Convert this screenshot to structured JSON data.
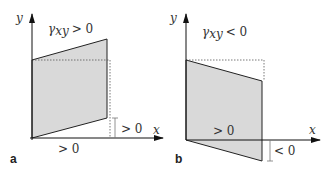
{
  "panels": [
    {
      "label": "a",
      "gamma": "γxy > 0",
      "gamma_sym": "γ",
      "gamma_sub": "xy",
      "gamma_rel": "> 0",
      "axis_x": "x",
      "axis_y": "y",
      "bottom_label": "> 0",
      "side_label": "> 0"
    },
    {
      "label": "b",
      "gamma": "γxy < 0",
      "gamma_sym": "γ",
      "gamma_sub": "xy",
      "gamma_rel": "< 0",
      "axis_x": "x",
      "axis_y": "y",
      "bottom_label": "> 0",
      "side_label": "< 0"
    }
  ],
  "colors": {
    "fill": "#d9d9d9",
    "line": "#222222"
  }
}
